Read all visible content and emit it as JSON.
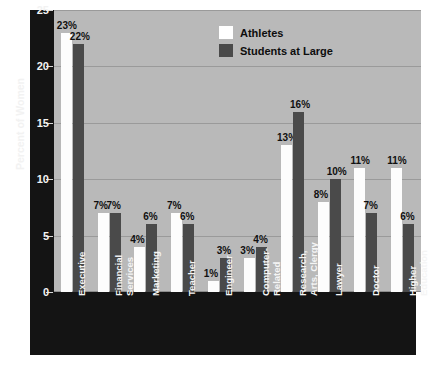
{
  "chart_data": {
    "type": "bar",
    "title": "",
    "xlabel": "",
    "ylabel": "Percent of Women",
    "ylim": [
      0,
      25
    ],
    "yticks": [
      0,
      5,
      10,
      15,
      20,
      25
    ],
    "ytick_labels": [
      "0",
      "5",
      "10",
      "15",
      "20",
      "25"
    ],
    "grid": true,
    "grid_axis": "y",
    "legend_position": "top-center-right",
    "value_label_suffix": "%",
    "categories": [
      "Executive",
      "Financial Services",
      "Marketing",
      "Teacher",
      "Engineer",
      "Computer-Related",
      "Research, Arts, Clergy",
      "Lawyer",
      "Doctor",
      "Higher Education"
    ],
    "category_lines": [
      [
        "Executive"
      ],
      [
        "Financial",
        "Services"
      ],
      [
        "Marketing"
      ],
      [
        "Teacher"
      ],
      [
        "Engineer"
      ],
      [
        "Computer-",
        "Related"
      ],
      [
        "Research,",
        "Arts, Clergy"
      ],
      [
        "Lawyer"
      ],
      [
        "Doctor"
      ],
      [
        "Higher",
        "Education"
      ]
    ],
    "series": [
      {
        "name": "Athletes",
        "color": "#ffffff",
        "values": [
          23,
          7,
          4,
          7,
          1,
          3,
          13,
          8,
          11,
          11
        ],
        "labels": [
          "23%",
          "7%",
          "4%",
          "7%",
          "1%",
          "3%",
          "13%",
          "8%",
          "11%",
          "11%"
        ]
      },
      {
        "name": "Students at Large",
        "color": "#4a4a4a",
        "values": [
          22,
          7,
          6,
          6,
          3,
          4,
          16,
          10,
          7,
          6
        ],
        "labels": [
          "22%",
          "7%",
          "6%",
          "6%",
          "3%",
          "4%",
          "16%",
          "10%",
          "7%",
          "6%"
        ]
      }
    ],
    "colors": {
      "plot_background": "#b9b9b9",
      "panel_background": "#141414",
      "gridline": "#9a9a9a",
      "axis_text": "#f2f2f2",
      "value_text": "#101010",
      "series_a": "#ffffff",
      "series_b": "#4a4a4a"
    }
  },
  "legend": {
    "items": [
      {
        "label": "Athletes",
        "swatch": "a"
      },
      {
        "label": "Students at Large",
        "swatch": "b"
      }
    ]
  }
}
